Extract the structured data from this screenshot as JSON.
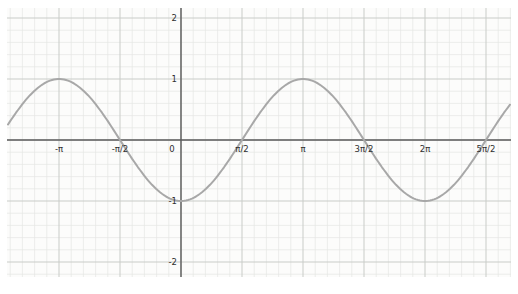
{
  "chart_data": {
    "type": "line",
    "title": "",
    "xlabel": "",
    "ylabel": "",
    "function": "y = -cos(x)",
    "amplitude": 1,
    "period_rad": 6.28319,
    "x_domain_rad": [
      -4.48,
      8.5
    ],
    "y_axis_range": [
      -2.2,
      2.2
    ],
    "grid": {
      "visible": true,
      "minor_per_major": 5
    },
    "legend": null,
    "x_ticks": [
      {
        "label": "-π",
        "value_half_pi": -2
      },
      {
        "label": "-π/2",
        "value_half_pi": -1
      },
      {
        "label": "0",
        "value_half_pi": 0
      },
      {
        "label": "π/2",
        "value_half_pi": 1
      },
      {
        "label": "π",
        "value_half_pi": 2
      },
      {
        "label": "3π/2",
        "value_half_pi": 3
      },
      {
        "label": "2π",
        "value_half_pi": 4
      },
      {
        "label": "5π/2",
        "value_half_pi": 5
      }
    ],
    "y_ticks": [
      {
        "label": "2",
        "value": 2
      },
      {
        "label": "1",
        "value": 1
      },
      {
        "label": "-1",
        "value": -1
      },
      {
        "label": "-2",
        "value": -2
      }
    ],
    "key_points": [
      {
        "x_rad": -3.14159,
        "y": 1
      },
      {
        "x_rad": -1.5708,
        "y": 0
      },
      {
        "x_rad": 0,
        "y": -1
      },
      {
        "x_rad": 1.5708,
        "y": 0
      },
      {
        "x_rad": 3.14159,
        "y": 1
      },
      {
        "x_rad": 4.71239,
        "y": 0
      },
      {
        "x_rad": 6.28319,
        "y": -1
      },
      {
        "x_rad": 7.85398,
        "y": 0
      }
    ]
  },
  "colors": {
    "paper": "#fcfcfb",
    "grid_minor": "#e5e7e4",
    "grid_major": "#c9ccc8",
    "axis": "#5c5c5c",
    "curve": "#a8a8a8",
    "tick_label": "#2e2e2e"
  }
}
